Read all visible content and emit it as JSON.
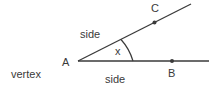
{
  "diagram": {
    "labels": {
      "vertex_point": "A",
      "point_upper": "C",
      "point_lower": "B",
      "angle": "x",
      "side_upper": "side",
      "side_lower": "side",
      "vertex": "vertex"
    },
    "colors": {
      "line": "#3a3a3a",
      "text": "#3a3a3a",
      "background": "#ffffff"
    }
  }
}
